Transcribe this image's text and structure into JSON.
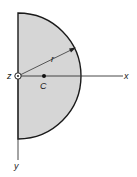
{
  "figure": {
    "shape": "semicircle",
    "fill_color": "#d6d6d6",
    "stroke_color": "#1a1a1a",
    "labels": {
      "radius": "r",
      "centroid": "C",
      "x_axis": "x",
      "y_axis": "y",
      "z_axis": "z"
    }
  }
}
